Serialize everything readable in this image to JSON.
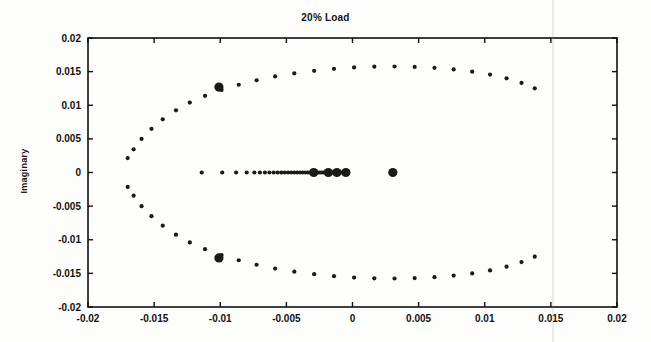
{
  "figure": {
    "title": "20% Load",
    "background_color": "#fdfdfc",
    "marker_color": "#1a1a1a",
    "axis_color": "#111111"
  },
  "axes": {
    "x_label": "",
    "y_label": "Imaginary",
    "x_ticks": [
      -0.02,
      -0.015,
      -0.01,
      -0.005,
      0,
      0.005,
      0.01,
      0.015,
      0.02
    ],
    "x_tick_labels": [
      "-0.02",
      "-0.015",
      "-0.01",
      "-0.005",
      "0",
      "0.005",
      "0.01",
      "0.015",
      "0.02"
    ],
    "y_ticks": [
      -0.02,
      -0.015,
      -0.01,
      -0.005,
      0,
      0.005,
      0.01,
      0.015,
      0.02
    ],
    "y_tick_labels": [
      "-0.02",
      "-0.015",
      "-0.01",
      "-0.005",
      "0",
      "0.005",
      "0.01",
      "0.015",
      "0.02"
    ]
  },
  "chart_data": {
    "type": "scatter",
    "title": "20% Load",
    "xlabel": "",
    "ylabel": "Imaginary",
    "xlim": [
      -0.02,
      0.02
    ],
    "ylim": [
      -0.02,
      0.02
    ],
    "grid": false,
    "legend": false,
    "series": [
      {
        "name": "poles-arc-upper",
        "marker": "dot",
        "marker_size": 2.1,
        "points": [
          [
            -0.017,
            0.00215
          ],
          [
            -0.01655,
            0.00345
          ],
          [
            -0.01595,
            0.005
          ],
          [
            -0.0152,
            0.0065
          ],
          [
            -0.01435,
            0.0079
          ],
          [
            -0.01335,
            0.00925
          ],
          [
            -0.0123,
            0.0104
          ],
          [
            -0.01115,
            0.0114
          ],
          [
            -0.0099,
            0.01228
          ],
          [
            -0.0086,
            0.01305
          ],
          [
            -0.00725,
            0.01372
          ],
          [
            -0.00585,
            0.01428
          ],
          [
            -0.0044,
            0.01474
          ],
          [
            -0.0029,
            0.01512
          ],
          [
            -0.0014,
            0.01542
          ],
          [
            0.00012,
            0.01562
          ],
          [
            0.00165,
            0.01573
          ],
          [
            0.00318,
            0.01576
          ],
          [
            0.0047,
            0.0157
          ],
          [
            0.0062,
            0.01556
          ],
          [
            0.00765,
            0.01533
          ],
          [
            0.00905,
            0.015
          ],
          [
            0.0104,
            0.01456
          ],
          [
            0.01165,
            0.014
          ],
          [
            0.01278,
            0.01332
          ],
          [
            0.01378,
            0.01252
          ]
        ]
      },
      {
        "name": "poles-arc-lower",
        "marker": "dot",
        "marker_size": 2.1,
        "points": [
          [
            -0.017,
            -0.00215
          ],
          [
            -0.01655,
            -0.00345
          ],
          [
            -0.01595,
            -0.005
          ],
          [
            -0.0152,
            -0.0065
          ],
          [
            -0.01435,
            -0.0079
          ],
          [
            -0.01335,
            -0.00925
          ],
          [
            -0.0123,
            -0.0104
          ],
          [
            -0.01115,
            -0.0114
          ],
          [
            -0.0099,
            -0.01228
          ],
          [
            -0.0086,
            -0.01305
          ],
          [
            -0.00725,
            -0.01372
          ],
          [
            -0.00585,
            -0.01428
          ],
          [
            -0.0044,
            -0.01474
          ],
          [
            -0.0029,
            -0.01512
          ],
          [
            -0.0014,
            -0.01542
          ],
          [
            0.00012,
            -0.01562
          ],
          [
            0.00165,
            -0.01573
          ],
          [
            0.00318,
            -0.01576
          ],
          [
            0.0047,
            -0.0157
          ],
          [
            0.0062,
            -0.01556
          ],
          [
            0.00765,
            -0.01533
          ],
          [
            0.00905,
            -0.015
          ],
          [
            0.0104,
            -0.01456
          ],
          [
            0.01165,
            -0.014
          ],
          [
            0.01278,
            -0.01332
          ],
          [
            0.01378,
            -0.01252
          ]
        ]
      },
      {
        "name": "poles-real-axis",
        "marker": "dot",
        "marker_size": 2.1,
        "points": [
          [
            -0.0114,
            0
          ],
          [
            -0.00985,
            0
          ],
          [
            -0.0088,
            0
          ],
          [
            -0.008,
            0
          ],
          [
            -0.00742,
            0
          ],
          [
            -0.007,
            0
          ],
          [
            -0.00662,
            0
          ],
          [
            -0.00628,
            0
          ],
          [
            -0.00596,
            0
          ],
          [
            -0.00566,
            0
          ],
          [
            -0.00538,
            0
          ],
          [
            -0.00512,
            0
          ],
          [
            -0.00487,
            0
          ],
          [
            -0.00463,
            0
          ],
          [
            -0.0044,
            0
          ],
          [
            -0.00418,
            0
          ],
          [
            -0.00397,
            0
          ],
          [
            -0.00377,
            0
          ],
          [
            -0.00357,
            0
          ],
          [
            -0.00338,
            0
          ],
          [
            -0.0032,
            0
          ],
          [
            -0.00302,
            0
          ],
          [
            -0.00285,
            0
          ],
          [
            -0.00268,
            0
          ],
          [
            -0.00252,
            0
          ],
          [
            -0.00236,
            0
          ],
          [
            -0.00221,
            0
          ],
          [
            -0.00206,
            0
          ],
          [
            -0.00192,
            0
          ],
          [
            -0.00178,
            0
          ],
          [
            -0.00164,
            0
          ],
          [
            -0.00151,
            0
          ],
          [
            -0.00138,
            0
          ],
          [
            -0.00125,
            0
          ],
          [
            -0.00113,
            0
          ],
          [
            -0.00101,
            0
          ],
          [
            -0.00089,
            0
          ],
          [
            -0.00077,
            0
          ],
          [
            -0.00066,
            0
          ],
          [
            -0.00055,
            0
          ],
          [
            -0.00044,
            0
          ],
          [
            -0.00033,
            0
          ]
        ]
      },
      {
        "name": "highlighted-poles",
        "marker": "filled-circle",
        "marker_size": 4.6,
        "points": [
          [
            -0.0101,
            0.0127
          ],
          [
            -0.0101,
            -0.0127
          ],
          [
            -0.00293,
            0
          ],
          [
            -0.00183,
            0
          ],
          [
            -0.00118,
            0
          ],
          [
            -0.0005,
            0
          ],
          [
            0.00305,
            0
          ]
        ]
      }
    ]
  }
}
